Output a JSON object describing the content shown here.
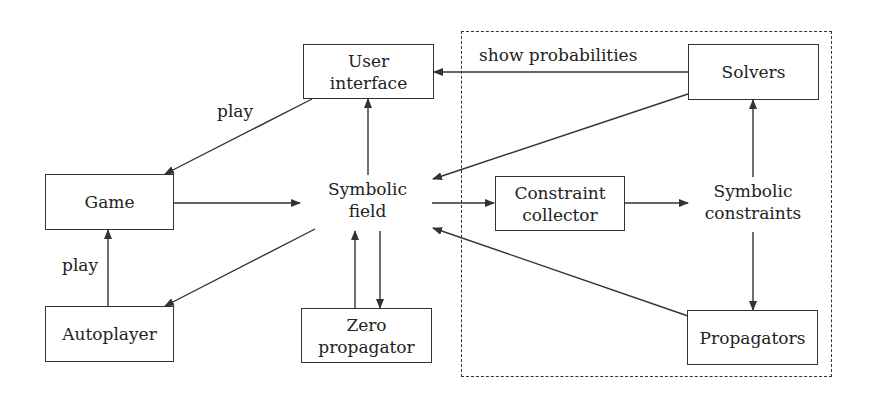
{
  "diagram": {
    "nodes": {
      "user_interface": [
        "User",
        "interface"
      ],
      "game": [
        "Game"
      ],
      "autoplayer": [
        "Autoplayer"
      ],
      "symbolic_field": [
        "Symbolic",
        "field"
      ],
      "zero_propagator": [
        "Zero",
        "propagator"
      ],
      "constraint_collector": [
        "Constraint",
        "collector"
      ],
      "symbolic_constraints": [
        "Symbolic",
        "constraints"
      ],
      "solvers": [
        "Solvers"
      ],
      "propagators": [
        "Propagators"
      ]
    },
    "edge_labels": {
      "ui_to_game": "play",
      "autoplayer_to_game": "play",
      "solvers_to_ui": "show probabilities"
    },
    "edges": [
      {
        "from": "user_interface",
        "to": "game",
        "label": "play"
      },
      {
        "from": "game",
        "to": "symbolic_field"
      },
      {
        "from": "symbolic_field",
        "to": "user_interface"
      },
      {
        "from": "symbolic_field",
        "to": "autoplayer"
      },
      {
        "from": "autoplayer",
        "to": "game",
        "label": "play"
      },
      {
        "from": "symbolic_field",
        "to": "zero_propagator"
      },
      {
        "from": "zero_propagator",
        "to": "symbolic_field"
      },
      {
        "from": "symbolic_field",
        "to": "constraint_collector"
      },
      {
        "from": "constraint_collector",
        "to": "symbolic_constraints"
      },
      {
        "from": "symbolic_constraints",
        "to": "solvers"
      },
      {
        "from": "symbolic_constraints",
        "to": "propagators"
      },
      {
        "from": "solvers",
        "to": "user_interface",
        "label": "show probabilities"
      },
      {
        "from": "solvers",
        "to": "symbolic_field"
      },
      {
        "from": "propagators",
        "to": "symbolic_field"
      }
    ],
    "groups": [
      {
        "name": "solver-subsystem",
        "style": "dashed",
        "members": [
          "constraint_collector",
          "symbolic_constraints",
          "solvers",
          "propagators"
        ]
      }
    ],
    "colors": {
      "stroke": "#333333",
      "background": "#ffffff"
    }
  }
}
